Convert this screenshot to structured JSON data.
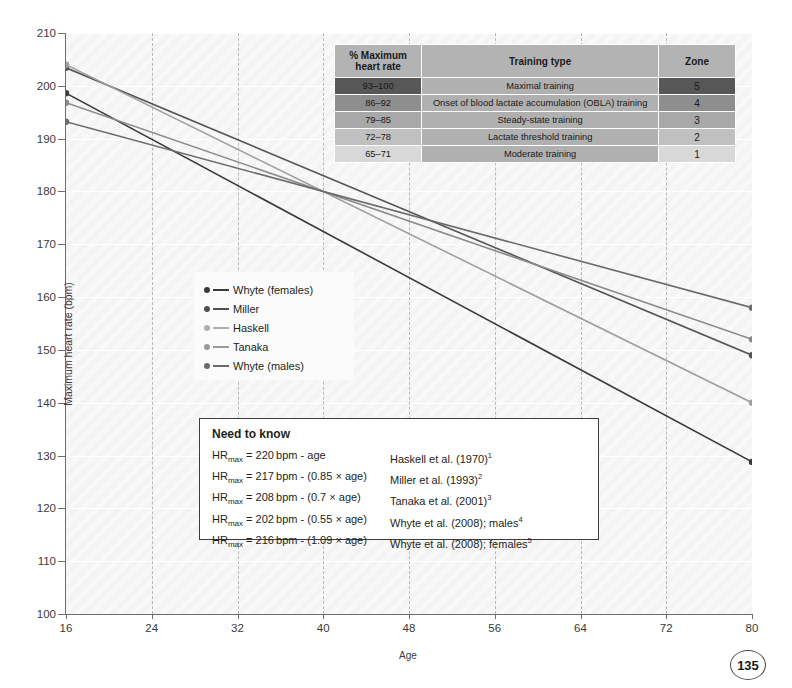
{
  "chart_data": {
    "type": "line",
    "title": "",
    "xlabel": "Age",
    "ylabel": "Maximum heart rate (bpm)",
    "xlim": [
      16,
      80
    ],
    "ylim": [
      100,
      210
    ],
    "x": [
      16,
      80
    ],
    "xticks": [
      16,
      24,
      32,
      40,
      48,
      56,
      64,
      72,
      80
    ],
    "yticks": [
      100,
      110,
      120,
      130,
      140,
      150,
      160,
      170,
      180,
      190,
      200,
      210
    ],
    "grid": "horizontal solid white, vertical dashed grey",
    "legend_position": "inside centre-left",
    "series": [
      {
        "name": "Whyte (females)",
        "values": [
          198.6,
          128.8
        ],
        "color": "#3a3a3a",
        "formula": "216 - 1.09 x age"
      },
      {
        "name": "Miller",
        "values": [
          203.4,
          149.0
        ],
        "color": "#555555",
        "formula": "217 - 0.85 x age"
      },
      {
        "name": "Haskell",
        "values": [
          204.0,
          140.0
        ],
        "color": "#a0a0a0",
        "formula": "220 - age"
      },
      {
        "name": "Tanaka",
        "values": [
          196.8,
          152.0
        ],
        "color": "#8a8a8a",
        "formula": "208 - 0.7 x age"
      },
      {
        "name": "Whyte (males)",
        "values": [
          193.2,
          158.0
        ],
        "color": "#6b6b6b",
        "formula": "202 - 0.55 x age"
      }
    ]
  },
  "legend": {
    "items": [
      {
        "label": "Whyte (females)",
        "color": "#3a3a3a"
      },
      {
        "label": "Miller",
        "color": "#4f4f4f"
      },
      {
        "label": "Haskell",
        "color": "#b0b0b0"
      },
      {
        "label": "Tanaka",
        "color": "#9a9a9a"
      },
      {
        "label": "Whyte (males)",
        "color": "#6b6b6b"
      }
    ]
  },
  "zone_table": {
    "headers": [
      "% Maximum heart rate",
      "Training type",
      "Zone"
    ],
    "header_pct_line1": "% Maximum",
    "header_pct_line2": "heart rate",
    "rows": [
      {
        "pct": "93–100",
        "type": "Maximal training",
        "zone": "5"
      },
      {
        "pct": "86–92",
        "type": "Onset of blood lactate accumulation (OBLA) training",
        "zone": "4"
      },
      {
        "pct": "79–85",
        "type": "Steady-state training",
        "zone": "3"
      },
      {
        "pct": "72–78",
        "type": "Lactate threshold training",
        "zone": "2"
      },
      {
        "pct": "65–71",
        "type": "Moderate training",
        "zone": "1"
      }
    ]
  },
  "need_to_know": {
    "title": "Need to know",
    "rows": [
      {
        "lhs": "HR",
        "sub": "max",
        "eq": " = 220 bpm - age",
        "cite": "Haskell et al. (1970)",
        "citesup": "1"
      },
      {
        "lhs": "HR",
        "sub": "max",
        "eq": " = 217 bpm - (0.85 × age)",
        "cite": "Miller et al. (1993)",
        "citesup": "2"
      },
      {
        "lhs": "HR",
        "sub": "max",
        "eq": " = 208 bpm - (0.7 × age)",
        "cite": "Tanaka et al. (2001)",
        "citesup": "3"
      },
      {
        "lhs": "HR",
        "sub": "max",
        "eq": " = 202 bpm - (0.55 × age)",
        "cite": "Whyte et al. (2008); males",
        "citesup": "4"
      },
      {
        "lhs": "HR",
        "sub": "max",
        "eq": " = 216 bpm - (1.09 × age)",
        "cite": "Whyte et al. (2008); females",
        "citesup": "5"
      }
    ]
  },
  "page": {
    "number": "135"
  },
  "colors": {
    "plot_background": "#f4f4f4",
    "axis": "#6d6d6d",
    "gridline_horizontal": "#ffffff",
    "gridline_vertical": "#b9b9b9",
    "table_header": "#b3b3b3",
    "zone5": "#575757",
    "zone4": "#8e8e8e",
    "zone3": "#a8a8a8",
    "zone2": "#c0c0c0",
    "zone1": "#d8d8d8"
  }
}
